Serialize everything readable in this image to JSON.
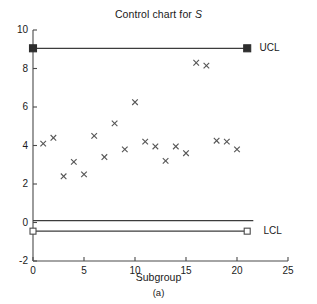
{
  "figure": {
    "title_prefix": "Control chart for ",
    "title_variable": "S",
    "caption": "(a)",
    "xlabel": "Subgroup",
    "ucl_label": "UCL",
    "lcl_label": "LCL",
    "line_color": "#3c3c3c",
    "marker_color": "#555555",
    "axis_color": "#4a4a4a",
    "background": "#ffffff"
  },
  "chart_data": {
    "type": "scatter",
    "title": "Control chart for S",
    "xlabel": "Subgroup",
    "ylabel": "",
    "xlim": [
      0,
      25
    ],
    "ylim": [
      -2,
      10
    ],
    "xticks": [
      0,
      5,
      10,
      15,
      20,
      25
    ],
    "yticks": [
      -2,
      0,
      2,
      4,
      6,
      8,
      10
    ],
    "xtick_labels": [
      "0",
      "5",
      "10",
      "15",
      "20",
      "25"
    ],
    "ytick_labels": [
      "-2",
      "0",
      "2",
      "4",
      "6",
      "8",
      "10"
    ],
    "grid": false,
    "legend": "none",
    "series": [
      {
        "name": "S",
        "marker": "x",
        "x": [
          1,
          2,
          3,
          4,
          5,
          6,
          7,
          8,
          9,
          10,
          11,
          12,
          13,
          14,
          15,
          16,
          17,
          18,
          19,
          20
        ],
        "values": [
          4.1,
          4.4,
          2.4,
          3.15,
          2.5,
          4.5,
          3.4,
          5.15,
          3.8,
          6.25,
          4.2,
          3.95,
          3.2,
          3.95,
          3.6,
          8.3,
          8.15,
          4.25,
          4.2,
          3.8
        ]
      }
    ],
    "control_lines": [
      {
        "name": "UCL",
        "value": 9.05,
        "label": "UCL",
        "marker": "filled-square",
        "x_start": 0,
        "x_end": 21
      },
      {
        "name": "CL",
        "value": 0.1,
        "label": "",
        "marker": "none",
        "x_start": 0,
        "x_end": 21.6
      },
      {
        "name": "LCL",
        "value": -0.45,
        "label": "LCL",
        "marker": "open-square",
        "x_start": 0,
        "x_end": 21
      }
    ],
    "annotations": [
      {
        "text": "UCL",
        "x": 22.2,
        "y": 9.05
      },
      {
        "text": "LCL",
        "x": 22.6,
        "y": -0.45
      }
    ]
  }
}
